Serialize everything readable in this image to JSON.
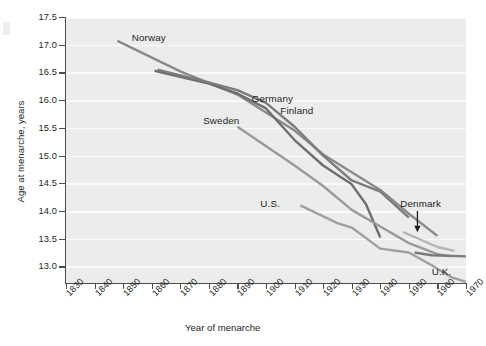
{
  "chart_data": {
    "type": "line",
    "title": "",
    "xlabel": "Year of menarche",
    "ylabel": "Age at menarche, years",
    "xlim": [
      1830,
      1970
    ],
    "ylim": [
      12.7,
      17.5
    ],
    "grid": true,
    "legend_position": "inline-labels",
    "xticks": [
      1830,
      1840,
      1850,
      1860,
      1870,
      1880,
      1890,
      1900,
      1910,
      1920,
      1930,
      1940,
      1950,
      1960,
      1970
    ],
    "yticks": [
      13.0,
      13.5,
      14.0,
      14.5,
      15.0,
      15.5,
      16.0,
      16.5,
      17.0,
      17.5
    ],
    "annotations": [
      {
        "text": "Denmark",
        "type": "arrow-label",
        "points_to_series": "Denmark"
      }
    ],
    "series": [
      {
        "name": "Norway",
        "color": "#8a8a8a",
        "label_x": 1853,
        "label_y": 17.12,
        "points": [
          {
            "x": 1848,
            "y": 17.07
          },
          {
            "x": 1870,
            "y": 16.52
          },
          {
            "x": 1890,
            "y": 16.1
          },
          {
            "x": 1910,
            "y": 15.45
          },
          {
            "x": 1920,
            "y": 15.02
          },
          {
            "x": 1930,
            "y": 14.7
          },
          {
            "x": 1940,
            "y": 14.38
          },
          {
            "x": 1950,
            "y": 13.95
          },
          {
            "x": 1960,
            "y": 13.55
          }
        ]
      },
      {
        "name": "Germany",
        "color": "#6e6e6e",
        "label_x": 1895,
        "label_y": 16.02,
        "points": [
          {
            "x": 1861,
            "y": 16.53
          },
          {
            "x": 1880,
            "y": 16.3
          },
          {
            "x": 1890,
            "y": 16.12
          },
          {
            "x": 1900,
            "y": 15.85
          },
          {
            "x": 1910,
            "y": 15.28
          },
          {
            "x": 1920,
            "y": 14.82
          },
          {
            "x": 1930,
            "y": 14.48
          },
          {
            "x": 1935,
            "y": 14.12
          },
          {
            "x": 1940,
            "y": 13.52
          }
        ]
      },
      {
        "name": "Finland",
        "color": "#7c7c7c",
        "label_x": 1905,
        "label_y": 15.8,
        "points": [
          {
            "x": 1862,
            "y": 16.55
          },
          {
            "x": 1880,
            "y": 16.32
          },
          {
            "x": 1890,
            "y": 16.18
          },
          {
            "x": 1900,
            "y": 15.95
          },
          {
            "x": 1910,
            "y": 15.52
          },
          {
            "x": 1920,
            "y": 15.0
          },
          {
            "x": 1930,
            "y": 14.55
          },
          {
            "x": 1940,
            "y": 14.35
          },
          {
            "x": 1950,
            "y": 13.88
          }
        ]
      },
      {
        "name": "Sweden",
        "color": "#9a9a9a",
        "label_x": 1878,
        "label_y": 15.62,
        "points": [
          {
            "x": 1890,
            "y": 15.52
          },
          {
            "x": 1910,
            "y": 14.82
          },
          {
            "x": 1920,
            "y": 14.45
          },
          {
            "x": 1930,
            "y": 14.02
          },
          {
            "x": 1940,
            "y": 13.72
          },
          {
            "x": 1950,
            "y": 13.42
          },
          {
            "x": 1960,
            "y": 13.22
          },
          {
            "x": 1965,
            "y": 13.18
          }
        ]
      },
      {
        "name": "U.S.",
        "color": "#9f9f9f",
        "label_x": 1898,
        "label_y": 14.12,
        "points": [
          {
            "x": 1912,
            "y": 14.1
          },
          {
            "x": 1925,
            "y": 13.78
          },
          {
            "x": 1930,
            "y": 13.7
          },
          {
            "x": 1940,
            "y": 13.32
          },
          {
            "x": 1950,
            "y": 13.25
          },
          {
            "x": 1958,
            "y": 13.02
          },
          {
            "x": 1965,
            "y": 12.8
          },
          {
            "x": 1970,
            "y": 12.72
          }
        ]
      },
      {
        "name": "Denmark",
        "color": "#b4b4b4",
        "label_x": 1947,
        "label_y": 14.12,
        "points": [
          {
            "x": 1948,
            "y": 13.62
          },
          {
            "x": 1960,
            "y": 13.35
          },
          {
            "x": 1966,
            "y": 13.28
          }
        ]
      },
      {
        "name": "U.K.",
        "color": "#7a7a7a",
        "label_x": 1958,
        "label_y": 12.9,
        "points": [
          {
            "x": 1952,
            "y": 13.25
          },
          {
            "x": 1958,
            "y": 13.2
          },
          {
            "x": 1970,
            "y": 13.18
          }
        ]
      }
    ]
  }
}
